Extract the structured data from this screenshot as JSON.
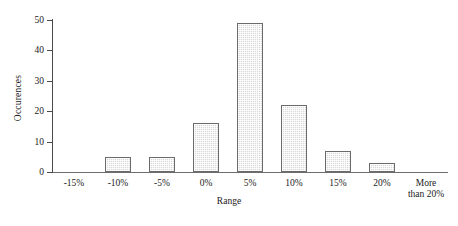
{
  "chart_data": {
    "type": "bar",
    "title": "",
    "subtitle": "",
    "xlabel": "Range",
    "ylabel": "Occurences",
    "categories": [
      "-15%",
      "-10%",
      "-5%",
      "0%",
      "5%",
      "10%",
      "15%",
      "20%",
      "More than 20%"
    ],
    "category_lines": [
      [
        "-15%"
      ],
      [
        "-10%"
      ],
      [
        "-5%"
      ],
      [
        "0%"
      ],
      [
        "5%"
      ],
      [
        "10%"
      ],
      [
        "15%"
      ],
      [
        "20%"
      ],
      [
        "More",
        "than 20%"
      ]
    ],
    "values": [
      0,
      5,
      5,
      16,
      49,
      22,
      7,
      3,
      0
    ],
    "ylim": [
      0,
      50
    ],
    "yticks": [
      0,
      10,
      20,
      30,
      40,
      50
    ],
    "ytick_labels": [
      "0",
      "10",
      "20",
      "30",
      "40",
      "50"
    ],
    "grid": false,
    "legend": false,
    "legend_position": "none",
    "colors": {
      "bar_fill": "#d9d9d9",
      "bar_border": "#6b6b6b",
      "axis": "#4a4a4a",
      "text": "#1a1a1a",
      "background": "#ffffff"
    }
  }
}
